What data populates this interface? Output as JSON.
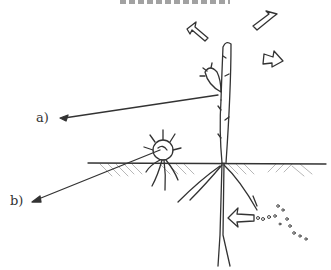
{
  "diagram": {
    "type": "hand-drawn biology sketch",
    "labels": {
      "a": "a)",
      "b": "b)"
    },
    "colors": {
      "ink": "#333333",
      "hatch": "#9a9a9a",
      "background": "#ffffff"
    },
    "elements": [
      {
        "name": "seedling-stem",
        "description": "upright stem with small leaf bud"
      },
      {
        "name": "outflow-arrows",
        "count": 3,
        "description": "open arrows pointing outward from top of plant"
      },
      {
        "name": "seed",
        "description": "round seed with radiating hairs at soil surface"
      },
      {
        "name": "soil-line",
        "description": "horizontal ground line with hatched soil"
      },
      {
        "name": "roots",
        "description": "branching roots below ground"
      },
      {
        "name": "inflow-arrow",
        "description": "open arrow pointing toward root from dotted particles"
      },
      {
        "name": "particles",
        "description": "small dots/circles at lower right"
      }
    ]
  }
}
